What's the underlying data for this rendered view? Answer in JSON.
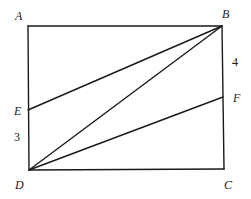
{
  "figure": {
    "points": {
      "A": {
        "label": "A"
      },
      "B": {
        "label": "B"
      },
      "C": {
        "label": "C"
      },
      "D": {
        "label": "D"
      },
      "E": {
        "label": "E"
      },
      "F": {
        "label": "F"
      }
    },
    "segments": [
      {
        "name": "AB",
        "from": "A",
        "to": "B"
      },
      {
        "name": "BC",
        "from": "B",
        "to": "C"
      },
      {
        "name": "CD",
        "from": "C",
        "to": "D"
      },
      {
        "name": "DA",
        "from": "D",
        "to": "A"
      },
      {
        "name": "BE",
        "from": "B",
        "to": "E"
      },
      {
        "name": "BD",
        "from": "B",
        "to": "D"
      },
      {
        "name": "DF",
        "from": "D",
        "to": "F"
      }
    ],
    "measures": {
      "BF": "4",
      "ED": "3"
    }
  }
}
